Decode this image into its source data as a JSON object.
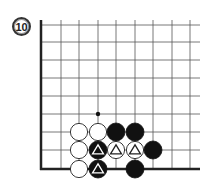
{
  "problem": {
    "number": "10"
  },
  "board": {
    "x_lines": [
      41,
      61,
      79,
      98,
      116,
      135,
      153,
      172,
      190
    ],
    "y_lines": [
      25,
      42,
      60,
      78,
      96,
      114,
      132,
      150,
      169
    ],
    "right_extent": 200,
    "top_extent": 20,
    "edge_left": true,
    "edge_bottom": true,
    "line_color": "#555555",
    "edge_color": "#222222"
  },
  "stones": [
    {
      "color": "white",
      "col": 2,
      "row": 6,
      "mark": ""
    },
    {
      "color": "white",
      "col": 3,
      "row": 6,
      "mark": ""
    },
    {
      "color": "black",
      "col": 4,
      "row": 6,
      "mark": ""
    },
    {
      "color": "black",
      "col": 5,
      "row": 6,
      "mark": ""
    },
    {
      "color": "white",
      "col": 2,
      "row": 7,
      "mark": ""
    },
    {
      "color": "black",
      "col": 3,
      "row": 7,
      "mark": "triangle"
    },
    {
      "color": "white",
      "col": 4,
      "row": 7,
      "mark": "triangle"
    },
    {
      "color": "white",
      "col": 5,
      "row": 7,
      "mark": "triangle"
    },
    {
      "color": "black",
      "col": 6,
      "row": 7,
      "mark": ""
    },
    {
      "color": "white",
      "col": 2,
      "row": 8,
      "mark": ""
    },
    {
      "color": "black",
      "col": 3,
      "row": 8,
      "mark": "triangle"
    },
    {
      "color": "black",
      "col": 5,
      "row": 8,
      "mark": ""
    }
  ],
  "markers": [
    {
      "type": "dot",
      "col": 3,
      "row": 5
    }
  ]
}
